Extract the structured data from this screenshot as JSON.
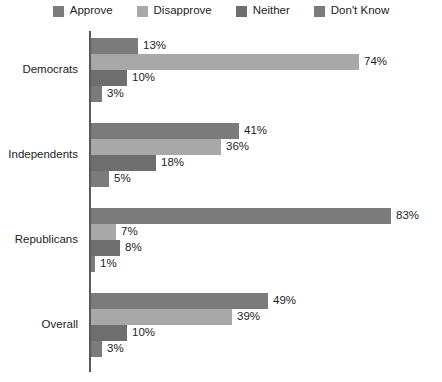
{
  "chart_data": {
    "type": "bar",
    "orientation": "horizontal",
    "title": "",
    "xlabel": "",
    "ylabel": "",
    "grid": false,
    "legend_position": "top",
    "xlim": [
      0,
      100
    ],
    "value_suffix": "%",
    "categories": [
      "Democrats",
      "Independents",
      "Republicans",
      "Overall"
    ],
    "series": [
      {
        "name": "Approve",
        "color": "#7b7b7b",
        "values": [
          13,
          41,
          83,
          49
        ],
        "labels": [
          "13%",
          "41%",
          "83%",
          "49%"
        ]
      },
      {
        "name": "Disapprove",
        "color": "#a8a8a8",
        "values": [
          74,
          36,
          7,
          39
        ],
        "labels": [
          "74%",
          "36%",
          "7%",
          "39%"
        ]
      },
      {
        "name": "Neither",
        "color": "#6e6e6e",
        "values": [
          10,
          18,
          8,
          10
        ],
        "labels": [
          "10%",
          "18%",
          "8%",
          "10%"
        ]
      },
      {
        "name": "Don't Know",
        "color": "#7b7b7b",
        "values": [
          3,
          5,
          1,
          3
        ],
        "labels": [
          "3%",
          "5%",
          "1%",
          "3%"
        ]
      }
    ],
    "axis_color": "#5a5a5a",
    "background_color": "#ffffff"
  }
}
